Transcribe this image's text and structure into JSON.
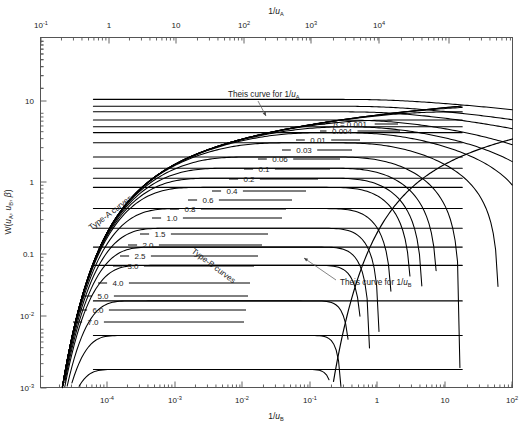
{
  "figure": {
    "background_color": "#ffffff",
    "line_color": "#000000",
    "axis_color": "#555555",
    "text_color": "#1a1a1a"
  },
  "axes": {
    "top": {
      "label_main": "1/",
      "label_var": "u",
      "label_sub": "A",
      "ticks": [
        {
          "value": 0.1,
          "base": "10",
          "exp": "-1",
          "x": 41
        },
        {
          "value": 1,
          "base": "1",
          "exp": "",
          "x": 109
        },
        {
          "value": 10,
          "base": "10",
          "exp": "",
          "x": 176
        },
        {
          "value": 100,
          "base": "10",
          "exp": "2",
          "x": 244
        },
        {
          "value": 1000,
          "base": "10",
          "exp": "3",
          "x": 311
        },
        {
          "value": 10000,
          "base": "10",
          "exp": "4",
          "x": 379
        }
      ]
    },
    "bottom": {
      "label_main": "1/",
      "label_var": "u",
      "label_sub": "B",
      "ticks": [
        {
          "value": 0.0001,
          "base": "10",
          "exp": "-4",
          "x": 107
        },
        {
          "value": 0.001,
          "base": "10",
          "exp": "-3",
          "x": 175
        },
        {
          "value": 0.01,
          "base": "10",
          "exp": "-2",
          "x": 242
        },
        {
          "value": 0.1,
          "base": "10",
          "exp": "-1",
          "x": 310
        },
        {
          "value": 1,
          "base": "1",
          "exp": "",
          "x": 377
        },
        {
          "value": 10,
          "base": "10",
          "exp": "",
          "x": 445
        },
        {
          "value": 100,
          "base": "10",
          "exp": "2",
          "x": 512
        }
      ]
    },
    "left": {
      "label_parts": [
        "W(",
        "u",
        "A",
        ", ",
        "u",
        "B",
        ", ",
        "β",
        ")"
      ],
      "ticks": [
        {
          "value": 10,
          "base": "10",
          "exp": "",
          "plain": "10",
          "y": 101
        },
        {
          "value": 1,
          "base": "1",
          "exp": "",
          "plain": "1",
          "y": 182
        },
        {
          "value": 0.1,
          "base": "0.1",
          "exp": "",
          "plain": "0.1",
          "y": 254
        },
        {
          "value": 0.01,
          "base": "10",
          "exp": "-2",
          "plain": "",
          "y": 316
        },
        {
          "value": 0.001,
          "base": "10",
          "exp": "-3",
          "plain": "",
          "y": 388
        }
      ]
    }
  },
  "chart_data": {
    "type": "line",
    "title": "",
    "xlabel": "1/u_B",
    "xlabel_top": "1/u_A",
    "ylabel": "W(u_A, u_B, β)",
    "xscale": "log",
    "yscale": "log",
    "xlim_top": [
      0.1,
      100000
    ],
    "xlim_bottom": [
      1.6e-05,
      100
    ],
    "ylim": [
      0.001,
      30
    ],
    "grid": false,
    "legend": "none",
    "parameter_symbol": "β",
    "parameter_label_prefix": "β = ",
    "beta_values": [
      0.001,
      0.004,
      0.01,
      0.03,
      0.06,
      0.1,
      0.2,
      0.4,
      0.6,
      0.8,
      1.0,
      1.5,
      2.0,
      2.5,
      3.0,
      4.0,
      5.0,
      6.0,
      7.0
    ],
    "curve_labels": [
      {
        "text": "β = 0.001",
        "x": 350,
        "y": 124,
        "lead_left": 318,
        "lead_right": 398,
        "lead_y": 124
      },
      {
        "text": "0.004",
        "x": 342,
        "y": 131,
        "lead_left": 320,
        "lead_right": 400,
        "lead_y": 131
      },
      {
        "text": "0.01",
        "x": 318,
        "y": 140,
        "lead_left": 296,
        "lead_right": 360,
        "lead_y": 140
      },
      {
        "text": "0.03",
        "x": 304,
        "y": 150,
        "lead_left": 282,
        "lead_right": 352,
        "lead_y": 150
      },
      {
        "text": "0.06",
        "x": 280,
        "y": 159,
        "lead_left": 258,
        "lead_right": 340,
        "lead_y": 159
      },
      {
        "text": "0.1",
        "x": 264,
        "y": 169,
        "lead_left": 244,
        "lead_right": 330,
        "lead_y": 169
      },
      {
        "text": "0.2",
        "x": 249,
        "y": 179,
        "lead_left": 229,
        "lead_right": 318,
        "lead_y": 179
      },
      {
        "text": "0.4",
        "x": 232,
        "y": 191,
        "lead_left": 212,
        "lead_right": 306,
        "lead_y": 191
      },
      {
        "text": "0.6",
        "x": 208,
        "y": 200,
        "lead_left": 188,
        "lead_right": 292,
        "lead_y": 200
      },
      {
        "text": "0.8",
        "x": 190,
        "y": 209,
        "lead_left": 170,
        "lead_right": 286,
        "lead_y": 209
      },
      {
        "text": "1.0",
        "x": 172,
        "y": 218,
        "lead_left": 152,
        "lead_right": 282,
        "lead_y": 218
      },
      {
        "text": "1.5",
        "x": 160,
        "y": 234,
        "lead_left": 140,
        "lead_right": 268,
        "lead_y": 234
      },
      {
        "text": "2.0",
        "x": 148,
        "y": 245,
        "lead_left": 128,
        "lead_right": 262,
        "lead_y": 245
      },
      {
        "text": "2.5",
        "x": 140,
        "y": 256,
        "lead_left": 120,
        "lead_right": 258,
        "lead_y": 256
      },
      {
        "text": "3.0",
        "x": 133,
        "y": 266,
        "lead_left": 113,
        "lead_right": 254,
        "lead_y": 266
      },
      {
        "text": "4.0",
        "x": 118,
        "y": 283,
        "lead_left": 98,
        "lead_right": 250,
        "lead_y": 283
      },
      {
        "text": "5.0",
        "x": 103,
        "y": 296,
        "lead_left": 83,
        "lead_right": 248,
        "lead_y": 296
      },
      {
        "text": "6.0",
        "x": 98,
        "y": 310,
        "lead_left": 78,
        "lead_right": 246,
        "lead_y": 310
      },
      {
        "text": "7.0",
        "x": 93,
        "y": 322,
        "lead_left": 73,
        "lead_right": 244,
        "lead_y": 322
      }
    ],
    "annotations": [
      {
        "name": "type-a-curves",
        "text": "Type-A curves",
        "x": 112,
        "y": 215,
        "rotation": -37
      },
      {
        "name": "type-b-curves",
        "text": "Type-B curves",
        "x": 212,
        "y": 268,
        "rotation": 37
      },
      {
        "name": "theis-a",
        "text_main": "Theis curve for 1/",
        "text_var": "u",
        "text_sub": "A",
        "x": 228,
        "y": 97,
        "arrow_from_x": 258,
        "arrow_from_y": 101,
        "arrow_to_x": 266,
        "arrow_to_y": 116
      },
      {
        "name": "theis-b",
        "text_main": "Theis curve for 1/",
        "text_var": "u",
        "text_sub": "B",
        "x": 340,
        "y": 285,
        "arrow_from_x": 336,
        "arrow_from_y": 280,
        "arrow_to_x": 304,
        "arrow_to_y": 258
      }
    ]
  }
}
